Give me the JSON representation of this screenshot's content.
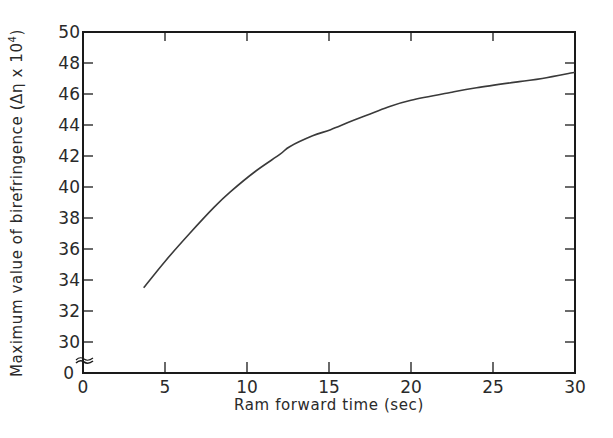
{
  "chart_data": {
    "type": "line",
    "title": "",
    "xlabel": "Ram forward time (sec)",
    "ylabel": "Maximum value of birefringence (Δη x 10⁴)",
    "ylabel_main": "Maximum value of birefringence (Δη x 10",
    "ylabel_sup": "4",
    "ylabel_close": ")",
    "xlim": [
      0,
      30
    ],
    "ylim": [
      30,
      50
    ],
    "y_axis_break": true,
    "y_origin_label": "0",
    "grid": false,
    "legend": null,
    "x_ticks": [
      0,
      5,
      10,
      15,
      20,
      25,
      30
    ],
    "x_tick_labels": [
      "0",
      "5",
      "10",
      "15",
      "20",
      "25",
      "30"
    ],
    "y_ticks": [
      30,
      32,
      34,
      36,
      38,
      40,
      42,
      44,
      46,
      48,
      50
    ],
    "y_tick_labels": [
      "30",
      "32",
      "34",
      "36",
      "38",
      "40",
      "42",
      "44",
      "46",
      "48",
      "50"
    ],
    "series": [
      {
        "name": "Maximum birefringence",
        "x": [
          3.7,
          5.0,
          6.5,
          8.0,
          9.0,
          10.5,
          12.0,
          12.6,
          14.0,
          15.1,
          16.5,
          18.7,
          20.0,
          22.4,
          24.0,
          26.6,
          28.0,
          30.0
        ],
        "y": [
          33.5,
          35.2,
          37.0,
          38.7,
          39.7,
          41.0,
          42.1,
          42.6,
          43.3,
          43.7,
          44.3,
          45.2,
          45.6,
          46.1,
          46.4,
          46.8,
          47.0,
          47.4
        ]
      }
    ]
  }
}
